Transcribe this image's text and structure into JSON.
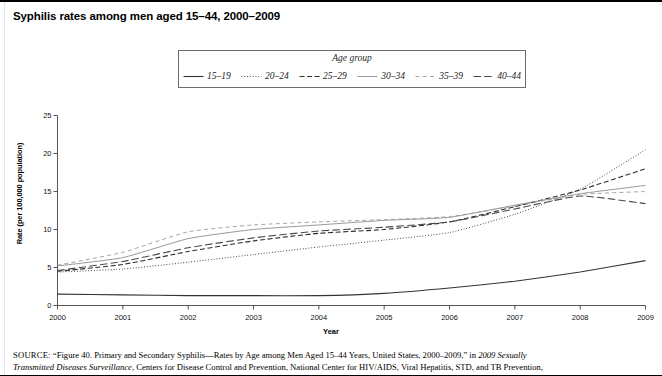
{
  "title": "Syphilis rates among men aged 15–44, 2000–2009",
  "legend": {
    "title": "Age group",
    "items": [
      {
        "label": "15–19",
        "style": "solid-bold",
        "color": "#333333"
      },
      {
        "label": "20–24",
        "style": "fine-dotted",
        "color": "#3a3a3a"
      },
      {
        "label": "25–29",
        "style": "dashed",
        "color": "#2e2e2e"
      },
      {
        "label": "30–34",
        "style": "solid-thin",
        "color": "#8c8c8c"
      },
      {
        "label": "35–39",
        "style": "sparse-dash",
        "color": "#9a9a9a"
      },
      {
        "label": "40–44",
        "style": "long-dash",
        "color": "#4a4a4a"
      }
    ]
  },
  "source": {
    "prefix": "SOURCE:",
    "line1_a": " “Figure 40. Primary and Secondary Syphilis—Rates by Age among Men Aged 15–44 Years, United States, 2000–2009,” in ",
    "line1_italic": "2009 Sexually",
    "line2_italic": "Transmitted Diseases Surveillance",
    "line2_b": ", Centers for Disease Control and Prevention, National Center for HIV/AIDS, Viral Hepatitis, STD, and TB Prevention,"
  },
  "chart_data": {
    "type": "line",
    "title": "Syphilis rates among men aged 15–44, 2000–2009",
    "xlabel": "Year",
    "ylabel": "Rate (per 100,000 population)",
    "x": [
      2000,
      2001,
      2002,
      2003,
      2004,
      2005,
      2006,
      2007,
      2008,
      2009
    ],
    "xlim": [
      2000,
      2009
    ],
    "ylim": [
      0,
      25
    ],
    "yticks": [
      0,
      5,
      10,
      15,
      20,
      25
    ],
    "xticks": [
      "2000",
      "2001",
      "2002",
      "2003",
      "2004",
      "2005",
      "2006",
      "2007",
      "2008",
      "2009"
    ],
    "grid": false,
    "legend_position": "top-center-boxed",
    "legend_title": "Age group",
    "series": [
      {
        "name": "15–19",
        "style": "solid-bold",
        "color": "#333333",
        "values": [
          1.5,
          1.4,
          1.3,
          1.3,
          1.3,
          1.6,
          2.3,
          3.2,
          4.4,
          5.9
        ]
      },
      {
        "name": "20–24",
        "style": "fine-dotted",
        "color": "#3a3a3a",
        "values": [
          4.4,
          4.8,
          5.7,
          6.7,
          7.7,
          8.6,
          9.6,
          12.0,
          15.3,
          20.5
        ]
      },
      {
        "name": "25–29",
        "style": "dashed",
        "color": "#2e2e2e",
        "values": [
          4.5,
          5.4,
          7.1,
          8.5,
          9.5,
          10.0,
          11.0,
          13.0,
          15.2,
          18.0
        ]
      },
      {
        "name": "30–34",
        "style": "solid-thin",
        "color": "#8c8c8c",
        "values": [
          5.2,
          6.3,
          8.8,
          10.0,
          10.6,
          11.2,
          11.6,
          13.2,
          14.7,
          15.8
        ]
      },
      {
        "name": "35–39",
        "style": "sparse-dash",
        "color": "#9a9a9a",
        "values": [
          5.3,
          7.0,
          9.7,
          10.6,
          11.0,
          11.3,
          11.7,
          13.1,
          14.6,
          15.0
        ]
      },
      {
        "name": "40–44",
        "style": "long-dash",
        "color": "#4a4a4a",
        "values": [
          4.6,
          5.8,
          7.6,
          8.9,
          9.8,
          10.3,
          11.0,
          12.7,
          14.4,
          13.4
        ]
      }
    ]
  }
}
